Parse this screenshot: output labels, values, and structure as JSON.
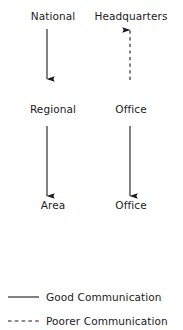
{
  "diagram": {
    "type": "flow-diagram",
    "background_color": "#ffffff",
    "line_color": "#1b1b1b",
    "text_color": "#1b1b1b",
    "columns": [
      {
        "name": "left-column",
        "nodes": [
          {
            "id": "national",
            "label": "National",
            "x": 53,
            "y": 10
          },
          {
            "id": "regional",
            "label": "Regional",
            "x": 53,
            "y": 103
          },
          {
            "id": "area",
            "label": "Area",
            "x": 53,
            "y": 199
          }
        ],
        "connectors": [
          {
            "id": "national-to-regional",
            "from": "national",
            "to": "regional",
            "style": "solid",
            "direction": "down",
            "meaning": "Good Communication"
          },
          {
            "id": "regional-to-area",
            "from": "regional",
            "to": "area",
            "style": "solid",
            "direction": "down",
            "meaning": "Good Communication"
          }
        ]
      },
      {
        "name": "right-column",
        "nodes": [
          {
            "id": "headquarters",
            "label": "Headquarters",
            "x": 131,
            "y": 10
          },
          {
            "id": "office-mid",
            "label": "Office",
            "x": 131,
            "y": 103
          },
          {
            "id": "office-bottom",
            "label": "Office",
            "x": 131,
            "y": 199
          }
        ],
        "connectors": [
          {
            "id": "office-to-headquarters",
            "from": "office-mid",
            "to": "headquarters",
            "style": "dashed",
            "direction": "up",
            "meaning": "Poorer Communication"
          },
          {
            "id": "office-to-office",
            "from": "office-mid",
            "to": "office-bottom",
            "style": "solid",
            "direction": "down",
            "meaning": "Good Communication"
          }
        ]
      }
    ]
  },
  "legend": {
    "items": [
      {
        "id": "good",
        "style": "solid",
        "label": "Good Communication",
        "y": 291
      },
      {
        "id": "poorer",
        "style": "dashed",
        "label": "Poorer Communication",
        "y": 315
      }
    ]
  }
}
